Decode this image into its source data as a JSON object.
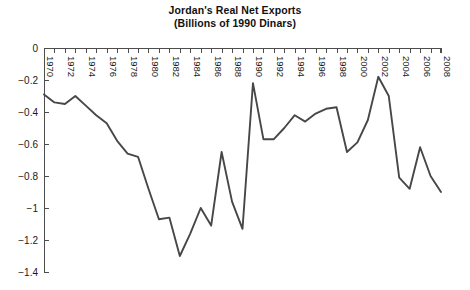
{
  "chart_data": {
    "type": "line",
    "title": "Jordan's Real Net Exports",
    "subtitle": "(Billions of 1990 Dinars)",
    "title_lines": [
      "Jordan's Real Net Exports",
      "(Billions of 1990 Dinars)"
    ],
    "xlabel": "",
    "ylabel": "",
    "ylim": [
      -1.4,
      0
    ],
    "xlim": [
      1970,
      2008
    ],
    "grid": false,
    "legend": null,
    "yticks": [
      0,
      -0.2,
      -0.4,
      -0.6,
      -0.8,
      -1,
      -1.2,
      -1.4
    ],
    "ytick_labels": [
      "0",
      "-0.2",
      "-0.4",
      "-0.6",
      "-0.8",
      "-1",
      "-1.2",
      "-1.4"
    ],
    "xticks": [
      1970,
      1972,
      1974,
      1976,
      1978,
      1980,
      1982,
      1984,
      1986,
      1988,
      1990,
      1992,
      1994,
      1996,
      1998,
      2000,
      2002,
      2004,
      2006,
      2008
    ],
    "xtick_labels": [
      "1970",
      "1972",
      "1974",
      "1976",
      "1978",
      "1980",
      "1982",
      "1984",
      "1986",
      "1988",
      "1990",
      "1992",
      "1994",
      "1996",
      "1998",
      "2000",
      "2002",
      "2004",
      "2006",
      "2008"
    ],
    "xtick_minor_step": 1,
    "line_color": "#474747",
    "series": [
      {
        "name": "Jordan's Real Net Exports",
        "x": [
          1970,
          1971,
          1972,
          1973,
          1974,
          1975,
          1976,
          1977,
          1978,
          1979,
          1980,
          1981,
          1982,
          1983,
          1984,
          1985,
          1986,
          1987,
          1988,
          1989,
          1990,
          1991,
          1992,
          1993,
          1994,
          1995,
          1996,
          1997,
          1998,
          1999,
          2000,
          2001,
          2002,
          2003,
          2004,
          2005,
          2006,
          2007,
          2008
        ],
        "values": [
          -0.29,
          -0.34,
          -0.35,
          -0.3,
          -0.36,
          -0.42,
          -0.47,
          -0.58,
          -0.66,
          -0.68,
          -0.88,
          -1.07,
          -1.06,
          -1.3,
          -1.16,
          -1.0,
          -1.11,
          -0.65,
          -0.96,
          -1.13,
          -0.22,
          -0.57,
          -0.57,
          -0.5,
          -0.42,
          -0.46,
          -0.41,
          -0.38,
          -0.37,
          -0.65,
          -0.59,
          -0.45,
          -0.18,
          -0.3,
          -0.81,
          -0.88,
          -0.62,
          -0.8,
          -0.9
        ]
      }
    ]
  }
}
